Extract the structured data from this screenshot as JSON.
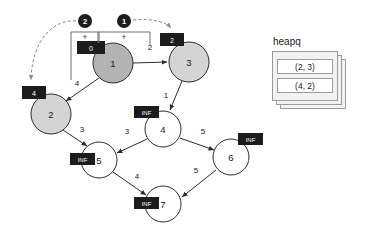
{
  "diagram": {
    "nodes": [
      {
        "id": "1",
        "label": "1",
        "dist": "0",
        "state": "visited",
        "cx": 113,
        "cy": 63,
        "r": 20,
        "fill": "dark",
        "tag_x": 77,
        "tag_y": 41,
        "tag_w": 28,
        "tag_h": 13
      },
      {
        "id": "3",
        "label": "3",
        "dist": "2",
        "state": "frontier",
        "cx": 189,
        "cy": 62,
        "r": 20,
        "fill": "light",
        "tag_x": 160,
        "tag_y": 33,
        "tag_w": 24,
        "tag_h": 13
      },
      {
        "id": "2",
        "label": "2",
        "dist": "4",
        "state": "frontier",
        "cx": 51,
        "cy": 114,
        "r": 20,
        "fill": "light",
        "tag_x": 22,
        "tag_y": 86,
        "tag_w": 24,
        "tag_h": 13
      },
      {
        "id": "4",
        "label": "4",
        "dist": "INF",
        "state": "unknown",
        "cx": 163,
        "cy": 129,
        "r": 18,
        "fill": "white",
        "tag_x": 134,
        "tag_y": 106,
        "tag_w": 25,
        "tag_h": 12
      },
      {
        "id": "5",
        "label": "5",
        "dist": "INF",
        "state": "unknown",
        "cx": 99,
        "cy": 160,
        "r": 18,
        "fill": "white",
        "tag_x": 70,
        "tag_y": 153,
        "tag_w": 25,
        "tag_h": 12
      },
      {
        "id": "6",
        "label": "6",
        "dist": "INF",
        "state": "unknown",
        "cx": 231,
        "cy": 157,
        "r": 18,
        "fill": "white",
        "tag_x": 238,
        "tag_y": 133,
        "tag_w": 25,
        "tag_h": 12
      },
      {
        "id": "7",
        "label": "7",
        "dist": "INF",
        "state": "unknown",
        "cx": 163,
        "cy": 204,
        "r": 18,
        "fill": "white",
        "tag_x": 134,
        "tag_y": 197,
        "tag_w": 25,
        "tag_h": 12
      }
    ],
    "edges": [
      {
        "from": "1",
        "to": "3",
        "weight": "2",
        "wx": 150,
        "wy": 47
      },
      {
        "from": "1",
        "to": "2",
        "weight": "4",
        "wx": 77,
        "wy": 83
      },
      {
        "from": "3",
        "to": "4",
        "weight": "1",
        "wx": 166,
        "wy": 95
      },
      {
        "from": "2",
        "to": "5",
        "weight": "3",
        "wx": 82,
        "wy": 129
      },
      {
        "from": "4",
        "to": "5",
        "weight": "3",
        "wx": 127,
        "wy": 131
      },
      {
        "from": "4",
        "to": "6",
        "weight": "5",
        "wx": 203,
        "wy": 131
      },
      {
        "from": "5",
        "to": "7",
        "weight": "4",
        "wx": 137,
        "wy": 176
      },
      {
        "from": "6",
        "to": "7",
        "weight": "5",
        "wx": 196,
        "wy": 170
      }
    ],
    "steps": [
      {
        "id": "step-2",
        "label": "❷",
        "number": "2",
        "cx": 85,
        "cy": 21,
        "r": 7,
        "operator": "+",
        "op_x": 85,
        "op_y": 36
      },
      {
        "id": "step-1",
        "label": "❶",
        "number": "1",
        "cx": 124,
        "cy": 21,
        "r": 7,
        "operator": "+",
        "op_x": 124,
        "op_y": 36
      }
    ]
  },
  "heapq": {
    "title": "heapq",
    "items": [
      "(2, 3)",
      "(4, 2)"
    ]
  }
}
